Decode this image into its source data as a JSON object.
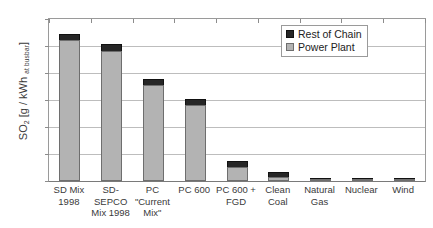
{
  "chart_data": {
    "type": "bar",
    "stacked": true,
    "title": "",
    "xlabel": "",
    "ylabel": "SO2 [g / kWh at busbar]",
    "ylabel_parts": {
      "main": "SO",
      "sub": "2",
      "unit": " [g / kWh ",
      "small": "at busbar",
      "close": "]"
    },
    "ylim": [
      0,
      12
    ],
    "ytick_step": 2,
    "yticks": [
      "12",
      "10",
      "8",
      "6",
      "4",
      "2",
      "0"
    ],
    "grid": true,
    "grid_axis": "y",
    "legend_position": "upper-right",
    "categories": [
      "SD Mix 1998",
      "SD-SEPCO Mix 1998",
      "PC \"Current Mix\"",
      "PC 600",
      "PC 600 + FGD",
      "Clean Coal",
      "Natural Gas",
      "Nuclear",
      "Wind"
    ],
    "category_lines": [
      [
        "SD Mix",
        "1998"
      ],
      [
        "SD-",
        "SEPCO",
        "Mix 1998"
      ],
      [
        "PC",
        "\"Current",
        "Mix\""
      ],
      [
        "PC 600"
      ],
      [
        "PC 600 +",
        "FGD"
      ],
      [
        "Clean",
        "Coal"
      ],
      [
        "Natural",
        "Gas"
      ],
      [
        "Nuclear"
      ],
      [
        "Wind"
      ]
    ],
    "series": [
      {
        "name": "Power Plant",
        "color": "#b3b3b3",
        "values": [
          10.42,
          9.6,
          7.1,
          5.6,
          1.05,
          0.27,
          0.02,
          0.02,
          0.02
        ]
      },
      {
        "name": "Rest of Chain",
        "color": "#262626",
        "values": [
          0.48,
          0.55,
          0.45,
          0.5,
          0.4,
          0.43,
          0.06,
          0.1,
          0.23
        ]
      }
    ],
    "totals": [
      10.9,
      10.15,
      7.55,
      6.1,
      1.45,
      0.7,
      0.08,
      0.12,
      0.25
    ]
  },
  "legend": {
    "items": [
      {
        "label": "Rest of Chain",
        "color": "#262626"
      },
      {
        "label": "Power Plant",
        "color": "#b3b3b3"
      }
    ]
  }
}
